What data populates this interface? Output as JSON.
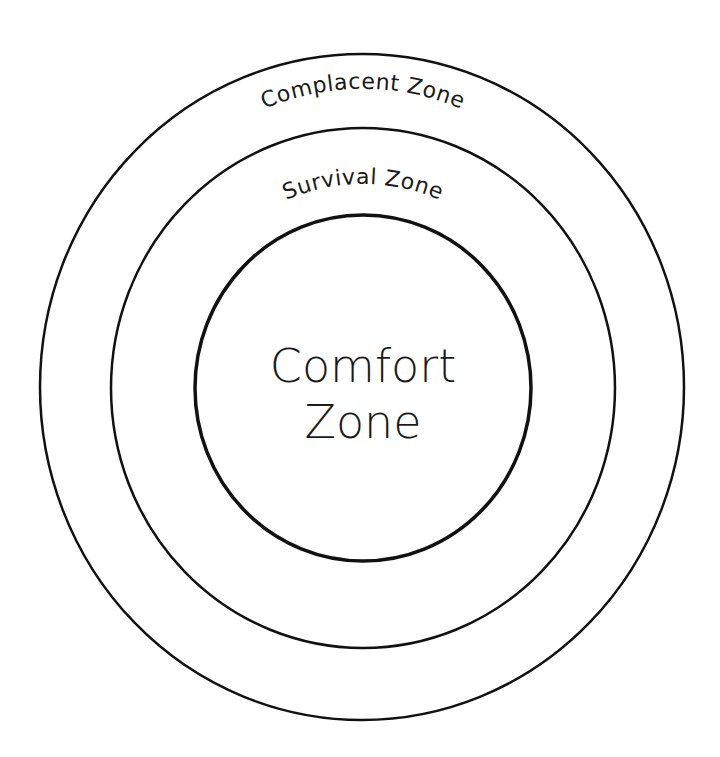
{
  "diagram": {
    "type": "concentric-circles",
    "colors": {
      "background": "#ffffff",
      "stroke": "#111111",
      "text": "#1a1a1a"
    },
    "rings": [
      {
        "name": "Complacent Zone",
        "label": "Complacent Zone",
        "position": "outer",
        "label_placement": "curved-top"
      },
      {
        "name": "Survival Zone",
        "label": "Survival Zone",
        "position": "middle",
        "label_placement": "curved-top"
      },
      {
        "name": "Comfort Zone",
        "label_lines": [
          "Comfort",
          "Zone"
        ],
        "position": "inner",
        "label_placement": "center"
      }
    ]
  }
}
